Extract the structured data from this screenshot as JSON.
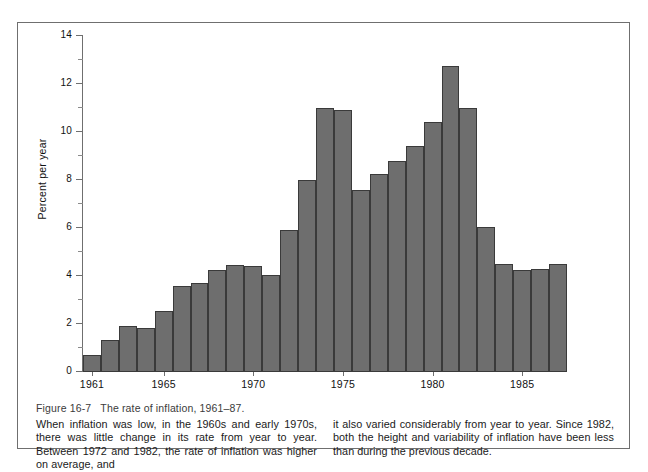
{
  "figure": {
    "label": "Figure 16-7",
    "title": "The rate of inflation, 1961–87.",
    "caption_left": "When inflation was low, in the 1960s and early 1970s, there was little change in its rate from year to year. Between 1972 and 1982, the rate of inflation was higher on average, and",
    "caption_right": "it also varied considerably from year to year. Since 1982, both the height and variability of inflation have been less than during the previous decade."
  },
  "colors": {
    "bar_fill": "#6e6e6e",
    "bar_outline": "#3a3a3a",
    "axis": "#6f6f6f",
    "frame": "#6f6f6f",
    "background": "#ffffff"
  },
  "chart_data": {
    "type": "bar",
    "title": "The rate of inflation, 1961–87",
    "xlabel": "",
    "ylabel": "Percent per year",
    "ylim": [
      0,
      14
    ],
    "y_major_ticks": [
      0,
      2,
      4,
      6,
      8,
      10,
      12,
      14
    ],
    "y_minor_ticks": [
      1,
      3,
      5,
      7,
      9,
      11,
      13
    ],
    "x_tick_labels": [
      "1961",
      "1965",
      "1970",
      "1975",
      "1980",
      "1985"
    ],
    "grid": false,
    "legend": null,
    "categories": [
      "1961",
      "1962",
      "1963",
      "1964",
      "1965",
      "1966",
      "1967",
      "1968",
      "1969",
      "1970",
      "1971",
      "1972",
      "1973",
      "1974",
      "1975",
      "1976",
      "1977",
      "1978",
      "1979",
      "1980",
      "1981",
      "1982",
      "1983",
      "1984",
      "1985",
      "1986",
      "1987"
    ],
    "values": [
      0.7,
      1.35,
      1.9,
      1.85,
      2.55,
      3.6,
      3.7,
      4.25,
      4.45,
      4.4,
      4.05,
      5.9,
      8.0,
      11.0,
      10.9,
      7.6,
      8.25,
      8.8,
      9.4,
      10.4,
      12.75,
      11.0,
      6.05,
      4.5,
      4.25,
      4.3,
      4.5
    ]
  }
}
